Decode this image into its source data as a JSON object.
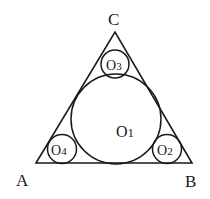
{
  "figure": {
    "background": "#ffffff",
    "stroke_color": "#1a1a1a",
    "triangle": {
      "vertices": {
        "A": {
          "label": "A",
          "x": 36,
          "y": 163
        },
        "B": {
          "label": "B",
          "x": 192,
          "y": 163
        },
        "C": {
          "label": "C",
          "x": 115,
          "y": 32
        }
      }
    },
    "circles": [
      {
        "id": "O1",
        "label_main": "O",
        "label_sub": "1",
        "cx": 116,
        "cy": 119,
        "r": 45
      },
      {
        "id": "O2",
        "label_main": "O",
        "label_sub": "2",
        "cx": 167,
        "cy": 149,
        "r": 15
      },
      {
        "id": "O3",
        "label_main": "O",
        "label_sub": "3",
        "cx": 115,
        "cy": 64,
        "r": 14
      },
      {
        "id": "O4",
        "label_main": "O",
        "label_sub": "4",
        "cx": 62,
        "cy": 149,
        "r": 15
      }
    ],
    "vertex_labels": {
      "A": "A",
      "B": "B",
      "C": "C"
    }
  }
}
